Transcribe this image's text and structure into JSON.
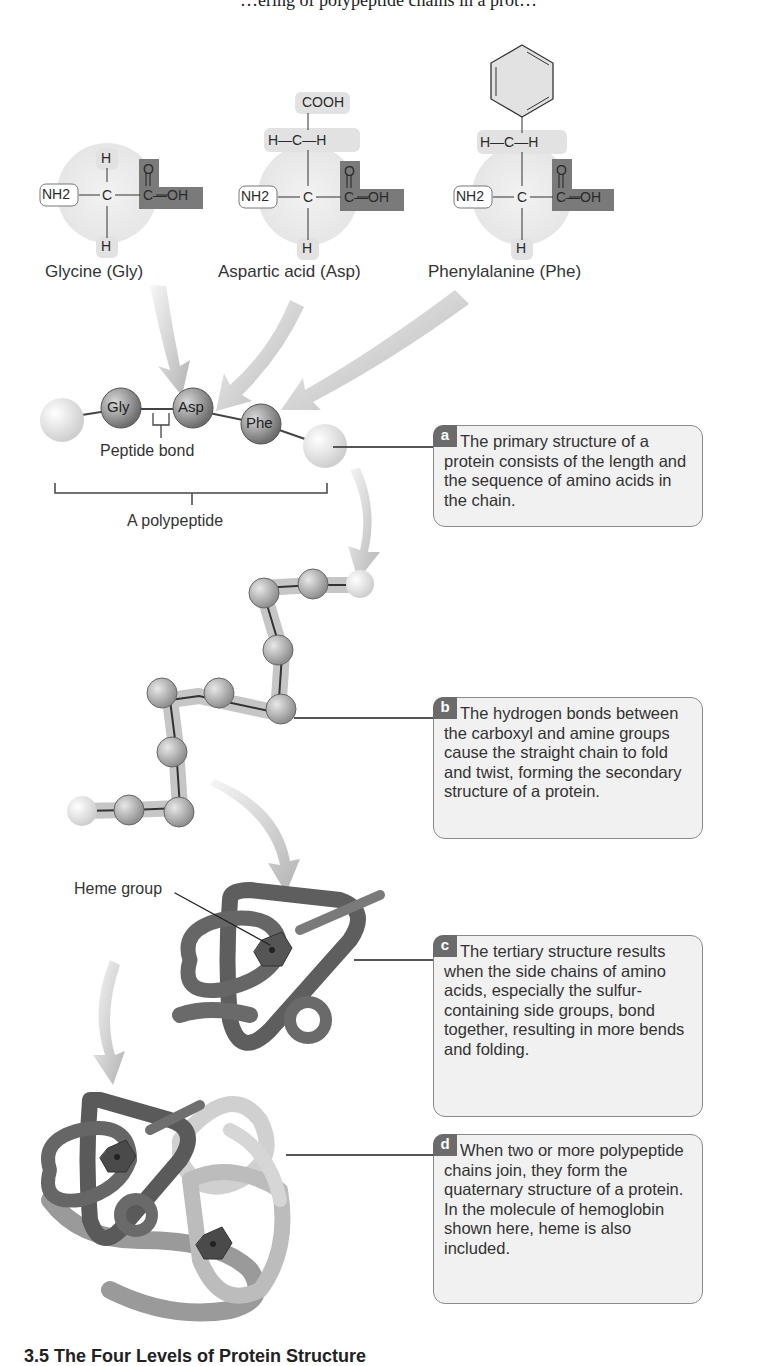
{
  "figure": {
    "title_partial": "…ering of polypeptide chains in a prot…",
    "caption_partial": "3.5  The Four Levels of Protein Structure"
  },
  "amino_acids": [
    {
      "name": "Glycine (Gly)",
      "abbrev": "Gly",
      "amine": "NH2",
      "central": "C",
      "carboxyl_top": "O",
      "carboxyl_right": "C—OH",
      "side_chain": [
        "H"
      ],
      "bottom": "H"
    },
    {
      "name": "Aspartic acid (Asp)",
      "abbrev": "Asp",
      "amine": "NH2",
      "central": "C",
      "carboxyl_top": "O",
      "carboxyl_right": "C—OH",
      "side_chain": [
        "COOH",
        "H—C—H"
      ],
      "bottom": "H"
    },
    {
      "name": "Phenylalanine (Phe)",
      "abbrev": "Phe",
      "amine": "NH2",
      "central": "C",
      "carboxyl_top": "O",
      "carboxyl_right": "C—OH",
      "side_chain": [
        "benzene-ring",
        "H—C—H"
      ],
      "bottom": "H"
    }
  ],
  "primary": {
    "beads": [
      "Gly",
      "Asp",
      "Phe"
    ],
    "peptide_bond_label": "Peptide bond",
    "polypeptide_label": "A polypeptide"
  },
  "tertiary": {
    "heme_label": "Heme group"
  },
  "notes": [
    {
      "badge": "a",
      "text": "The primary structure of a protein consists of the length and the sequence of amino acids in the chain."
    },
    {
      "badge": "b",
      "text": "The hydrogen bonds between the carboxyl and amine groups cause the straight chain to fold and twist, forming the secondary structure of a protein."
    },
    {
      "badge": "c",
      "text": "The tertiary structure results when the side chains of amino acids, especially the sulfur-containing side groups, bond together, resulting in more bends and folding."
    },
    {
      "badge": "d",
      "text": "When two or more polypeptide chains join, they form the quaternary structure of a protein. In the molecule of hemoglobin shown here, heme is also included."
    }
  ],
  "colors": {
    "badge": "#6b6b6b",
    "box_fill": "#f1f1f1",
    "box_border": "#8a8a8a",
    "carboxyl_fill": "#7a7a7a",
    "side_chain_fill": "#e2e2e2",
    "halo_fill": "#ececec",
    "bead_dark": "#8c8c8c",
    "ribbon_dark": "#5e5e5e",
    "ribbon_light": "#c9c9c9"
  }
}
